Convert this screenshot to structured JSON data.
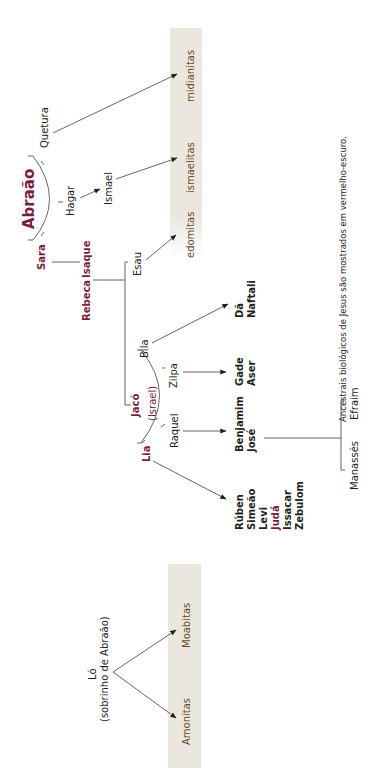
{
  "caption": "Ancestrais biológicos de Jesus são mostrados em vermelho-escuro.",
  "colors": {
    "ancestor": "#7b1d3f",
    "text": "#231f20",
    "band": "#ebe7df",
    "nation_text": "#6b4a2e",
    "lines": "#555555"
  },
  "people": {
    "abraao": "Abraão",
    "sara": "Sara",
    "hagar": "Hagar",
    "quetura": "Quetura",
    "ismael": "Ismael",
    "isaque": "Isaque",
    "rebeca": "Rebeca",
    "esau": "Esau",
    "jaco": "Jacó",
    "israel": "(Israel)",
    "lia": "Lia",
    "raquel": "Raquel",
    "zilpa": "Zilpa",
    "bila": "Bila",
    "lo": "Ló",
    "lo_note": "(sobrinho de Abraão)"
  },
  "nations": {
    "midianitas": "midianitas",
    "ismaelitas": "ismaelitas",
    "edomitas": "edomitas",
    "moabitas": "Moabitas",
    "amonitas": "Amonitas"
  },
  "sons": {
    "bila": [
      "Dã",
      "Naftali"
    ],
    "zilpa": [
      "Gade",
      "Aser"
    ],
    "raquel": [
      "Benjamim",
      "José"
    ],
    "lia": [
      "Rúben",
      "Simeão",
      "Levi",
      "Judá",
      "Issacar",
      "Zebulom"
    ],
    "jose": [
      "Manassés",
      "Efraim"
    ]
  }
}
